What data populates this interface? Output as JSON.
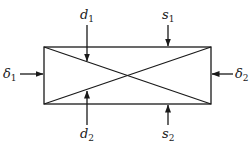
{
  "diagram": {
    "type": "rectangular element with crossed diagonals and boundary load arrows",
    "colors": {
      "line": "#1a1a1a",
      "background": "#ffffff"
    },
    "labels": {
      "d1": {
        "base": "d",
        "sub": "1"
      },
      "s1": {
        "base": "s",
        "sub": "1"
      },
      "delta1": {
        "base": "δ",
        "sub": "1"
      },
      "delta2": {
        "base": "δ",
        "sub": "2"
      },
      "d2": {
        "base": "d",
        "sub": "2"
      },
      "s2": {
        "base": "s",
        "sub": "2"
      }
    }
  }
}
